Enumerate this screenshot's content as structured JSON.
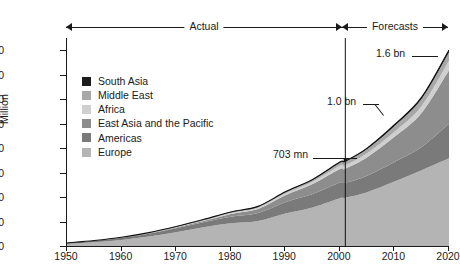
{
  "header": {
    "actual_label": "Actual",
    "forecasts_label": "Forecasts"
  },
  "axes": {
    "ylabel": "Million",
    "yticks": [
      "0",
      "200",
      "400",
      "600",
      "800",
      "1,000",
      "1,200",
      "1,400",
      "1,600"
    ],
    "xticks": [
      "1950",
      "1960",
      "1970",
      "1980",
      "1990",
      "2000",
      "2010",
      "2020"
    ]
  },
  "legend": [
    {
      "label": "South Asia",
      "color": "#1c1c1c"
    },
    {
      "label": "Middle East",
      "color": "#a8a8a8"
    },
    {
      "label": "Africa",
      "color": "#cfcfcf"
    },
    {
      "label": "East Asia and the Pacific",
      "color": "#8d8d8d"
    },
    {
      "label": "Americas",
      "color": "#7a7a7a"
    },
    {
      "label": "Europe",
      "color": "#b4b4b4"
    }
  ],
  "callouts": [
    {
      "name": "callout-703mn",
      "text": "703 mn"
    },
    {
      "name": "callout-1bn",
      "text": "1.0 bn"
    },
    {
      "name": "callout-16bn",
      "text": "1.6 bn"
    }
  ],
  "chart_data": {
    "type": "area",
    "title": "",
    "xlabel": "",
    "ylabel": "Million",
    "xlim": [
      1950,
      2020
    ],
    "ylim": [
      0,
      1700
    ],
    "grid": false,
    "legend_position": "inside-upper-left",
    "stacked": true,
    "actual_range": [
      1950,
      2001
    ],
    "forecast_range": [
      2001,
      2020
    ],
    "divider_x": 2001,
    "annotations": [
      {
        "text": "703 mn",
        "x": 2001,
        "y": 703
      },
      {
        "text": "1.0 bn",
        "x": 2010,
        "y": 1006
      },
      {
        "text": "1.6 bn",
        "x": 2020,
        "y": 1600
      }
    ],
    "x": [
      1950,
      1955,
      1960,
      1965,
      1970,
      1975,
      1980,
      1985,
      1990,
      1995,
      2000,
      2001,
      2005,
      2010,
      2015,
      2020
    ],
    "series": [
      {
        "name": "Europe",
        "color": "#b4b4b4",
        "values": [
          17,
          30,
          50,
          78,
          113,
          153,
          186,
          204,
          265,
          315,
          390,
          395,
          440,
          527,
          620,
          717
        ]
      },
      {
        "name": "Americas",
        "color": "#7a7a7a",
        "values": [
          7,
          12,
          17,
          23,
          33,
          41,
          53,
          65,
          93,
          109,
          128,
          122,
          135,
          160,
          190,
          282
        ]
      },
      {
        "name": "East Asia and the Pacific",
        "color": "#8d8d8d",
        "values": [
          0.2,
          1,
          2,
          3,
          6,
          10,
          23,
          33,
          56,
          82,
          111,
          115,
          150,
          205,
          280,
          438
        ]
      },
      {
        "name": "Africa",
        "color": "#cfcfcf",
        "values": [
          0.5,
          1,
          1,
          2,
          3,
          5,
          7,
          10,
          15,
          20,
          27,
          28,
          33,
          42,
          55,
          77
        ]
      },
      {
        "name": "Middle East",
        "color": "#a8a8a8",
        "values": [
          0.2,
          0.5,
          1,
          2,
          3,
          5,
          7,
          9,
          10,
          14,
          24,
          28,
          34,
          46,
          58,
          69
        ]
      },
      {
        "name": "South Asia",
        "color": "#1c1c1c",
        "values": [
          0.2,
          0.3,
          0.5,
          1,
          1,
          2,
          2,
          3,
          4,
          4,
          6,
          6,
          8,
          11,
          14,
          19
        ]
      }
    ]
  }
}
